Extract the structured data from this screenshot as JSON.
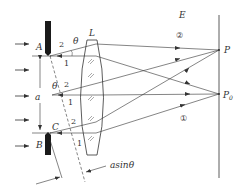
{
  "diagram": {
    "type": "single-slit diffraction (half-period zone construction)",
    "labels": {
      "A": "A",
      "B": "B",
      "C": "C",
      "L": "L",
      "E": "E",
      "P": "P",
      "P0": "P",
      "P0_sub": "0",
      "a": "a",
      "theta_top": "θ",
      "theta_mid": "θ",
      "asin": "asinθ",
      "ray1_top": "1",
      "ray2_top": "2",
      "ray1_mid": "1",
      "ray2_mid": "2",
      "ray1_bot": "1",
      "ray2_bot": "2",
      "circled2": "②",
      "circled1": "①"
    },
    "colors": {
      "line": "#333333",
      "slit": "#1a1a1a",
      "background": "#ffffff"
    }
  }
}
